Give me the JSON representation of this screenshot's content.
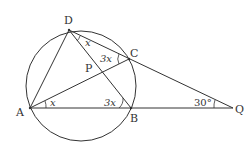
{
  "diagram": {
    "type": "geometry",
    "stroke_color": "#333333",
    "circle": {
      "center": [
        81,
        86
      ],
      "r": 55
    },
    "points": {
      "D": {
        "label": "D",
        "x": 69,
        "y": 30
      },
      "C": {
        "label": "C",
        "x": 129,
        "y": 59
      },
      "A": {
        "label": "A",
        "x": 30,
        "y": 108
      },
      "B": {
        "label": "B",
        "x": 131,
        "y": 108
      },
      "Q": {
        "label": "Q",
        "x": 233,
        "y": 108
      },
      "P": {
        "label": "P",
        "x": 103,
        "y": 72
      }
    },
    "angles": {
      "CDB": {
        "text": "x"
      },
      "DCA": {
        "text": "3x"
      },
      "CAB": {
        "text": "x"
      },
      "ABD": {
        "text": "3x"
      },
      "AQC": {
        "text": "30°"
      }
    }
  }
}
